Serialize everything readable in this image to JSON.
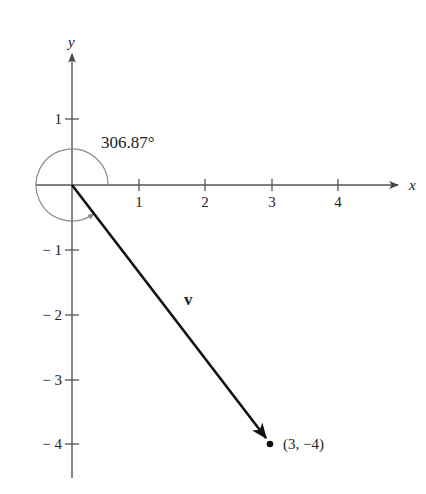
{
  "figure": {
    "type": "vector-diagram",
    "axes": {
      "x_label": "x",
      "y_label": "y",
      "x_ticks": [
        {
          "value": 1,
          "label": "1"
        },
        {
          "value": 2,
          "label": "2"
        },
        {
          "value": 3,
          "label": "3"
        },
        {
          "value": 4,
          "label": "4"
        }
      ],
      "y_ticks": [
        {
          "value": 1,
          "label": "1"
        },
        {
          "value": -1,
          "label": "− 1"
        },
        {
          "value": -2,
          "label": "− 2"
        },
        {
          "value": -3,
          "label": "− 3"
        },
        {
          "value": -4,
          "label": "− 4"
        }
      ]
    },
    "vector": {
      "label": "v",
      "from": [
        0,
        0
      ],
      "to": [
        3,
        -4
      ]
    },
    "point": {
      "label": "(3,  −4)",
      "x": 3,
      "y": -4
    },
    "angle": {
      "label": "306.87°",
      "degrees": 306.87
    },
    "colors": {
      "axis": "#555555",
      "vector": "#111111",
      "angle_arc": "#8a8a8a",
      "text": "#222222"
    }
  }
}
